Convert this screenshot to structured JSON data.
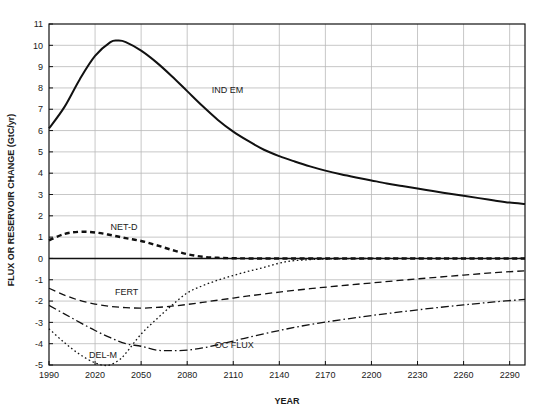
{
  "chart_data": {
    "type": "line",
    "title": "",
    "xlabel": "YEAR",
    "ylabel": "FLUX OR RESERVOIR CHANGE (GtC/yr)",
    "xlim": [
      1990,
      2300
    ],
    "ylim": [
      -5,
      11
    ],
    "xticks": [
      1990,
      2020,
      2050,
      2080,
      2110,
      2140,
      2170,
      2200,
      2230,
      2260,
      2290
    ],
    "yticks": [
      -5,
      -4,
      -3,
      -2,
      -1,
      0,
      1,
      2,
      3,
      4,
      5,
      6,
      7,
      8,
      9,
      10,
      11
    ],
    "grid": true,
    "legend_position": "inline-annotations",
    "zero_line": 0,
    "series": [
      {
        "name": "IND EM",
        "style": "solid",
        "color": "#111111",
        "width": 2.0,
        "label_x": 2096,
        "label_y": 7.75,
        "x": [
          1990,
          2000,
          2010,
          2020,
          2030,
          2035,
          2040,
          2050,
          2060,
          2070,
          2080,
          2090,
          2100,
          2110,
          2120,
          2130,
          2140,
          2150,
          2160,
          2170,
          2180,
          2190,
          2200,
          2210,
          2220,
          2230,
          2240,
          2250,
          2260,
          2270,
          2280,
          2290,
          2300
        ],
        "values": [
          6.1,
          7.1,
          8.4,
          9.5,
          10.15,
          10.22,
          10.15,
          9.75,
          9.2,
          8.55,
          7.85,
          7.15,
          6.5,
          5.95,
          5.5,
          5.1,
          4.8,
          4.55,
          4.32,
          4.12,
          3.95,
          3.8,
          3.66,
          3.52,
          3.4,
          3.28,
          3.16,
          3.05,
          2.94,
          2.83,
          2.72,
          2.62,
          2.55
        ]
      },
      {
        "name": "NET-D",
        "style": "dashed-thick",
        "color": "#111111",
        "width": 2.4,
        "label_x": 2030,
        "label_y": 1.35,
        "x": [
          1990,
          2000,
          2010,
          2020,
          2030,
          2040,
          2050,
          2060,
          2070,
          2080,
          2090,
          2100,
          2110,
          2120,
          2140,
          2170,
          2200,
          2230,
          2260,
          2300
        ],
        "values": [
          0.85,
          1.15,
          1.25,
          1.22,
          1.1,
          0.95,
          0.82,
          0.62,
          0.4,
          0.2,
          0.08,
          0.03,
          0.01,
          0.0,
          0.0,
          0.0,
          0.0,
          0.0,
          0.0,
          0.0
        ]
      },
      {
        "name": "FERT",
        "style": "dashed-long",
        "color": "#111111",
        "width": 1.3,
        "label_x": 2033,
        "label_y": -1.72,
        "x": [
          1990,
          2000,
          2010,
          2020,
          2030,
          2040,
          2050,
          2060,
          2070,
          2080,
          2090,
          2100,
          2110,
          2120,
          2140,
          2160,
          2180,
          2200,
          2220,
          2240,
          2260,
          2280,
          2300
        ],
        "values": [
          -1.4,
          -1.72,
          -1.97,
          -2.14,
          -2.25,
          -2.31,
          -2.33,
          -2.3,
          -2.24,
          -2.16,
          -2.06,
          -1.96,
          -1.86,
          -1.76,
          -1.58,
          -1.42,
          -1.28,
          -1.15,
          -1.02,
          -0.9,
          -0.78,
          -0.67,
          -0.58
        ]
      },
      {
        "name": "DEL-M",
        "style": "dotted",
        "color": "#111111",
        "width": 1.3,
        "label_x": 2016,
        "label_y": -4.66,
        "x": [
          1990,
          2000,
          2010,
          2020,
          2028,
          2035,
          2040,
          2050,
          2060,
          2070,
          2080,
          2090,
          2100,
          2110,
          2120,
          2130,
          2140,
          2150,
          2170,
          2200,
          2230,
          2260,
          2300
        ],
        "values": [
          -3.3,
          -3.95,
          -4.5,
          -4.9,
          -5.02,
          -4.8,
          -4.45,
          -3.55,
          -2.85,
          -2.2,
          -1.62,
          -1.28,
          -1.02,
          -0.8,
          -0.6,
          -0.42,
          -0.22,
          -0.1,
          -0.03,
          0.0,
          0.0,
          0.0,
          0.0
        ]
      },
      {
        "name": "OC FLUX",
        "style": "dashdot",
        "color": "#111111",
        "width": 1.3,
        "label_x": 2098,
        "label_y": -4.22,
        "x": [
          1990,
          2000,
          2010,
          2020,
          2030,
          2040,
          2050,
          2060,
          2070,
          2080,
          2090,
          2100,
          2110,
          2120,
          2140,
          2160,
          2180,
          2200,
          2220,
          2240,
          2260,
          2280,
          2300
        ],
        "values": [
          -2.2,
          -2.6,
          -3.0,
          -3.38,
          -3.72,
          -4.0,
          -4.12,
          -4.3,
          -4.33,
          -4.3,
          -4.2,
          -4.05,
          -3.88,
          -3.7,
          -3.38,
          -3.1,
          -2.88,
          -2.68,
          -2.5,
          -2.33,
          -2.18,
          -2.04,
          -1.92
        ]
      }
    ]
  }
}
